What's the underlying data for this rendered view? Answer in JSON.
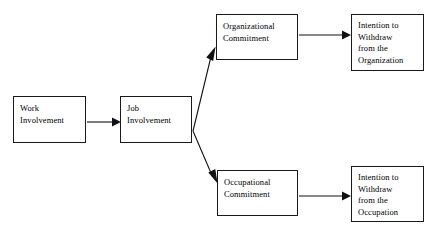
{
  "diagram": {
    "background_color": "#ffffff",
    "line_color": "#111111",
    "text_color": "#000000",
    "box_border_color": "#1a1a1a",
    "nodes": [
      {
        "id": "work-involvement",
        "label": "Work\nInvolvement",
        "x": 13,
        "y": 96,
        "w": 73,
        "h": 47
      },
      {
        "id": "job-involvement",
        "label": "Job\nInvolvement",
        "x": 120,
        "y": 96,
        "w": 72,
        "h": 47
      },
      {
        "id": "organizational-commitment",
        "label": "Organizational\nCommitment",
        "x": 216,
        "y": 14,
        "w": 82,
        "h": 46
      },
      {
        "id": "occupational-commitment",
        "label": "Occupational\nCommitment",
        "x": 217,
        "y": 170,
        "w": 81,
        "h": 46
      },
      {
        "id": "intention-withdraw-organization",
        "label": "Intention to\nWithdraw\nfrom the\nOrganization",
        "x": 351,
        "y": 14,
        "w": 73,
        "h": 57
      },
      {
        "id": "intention-withdraw-occupation",
        "label": "Intention to\nWithdraw\nfrom the\nOccupation",
        "x": 351,
        "y": 166,
        "w": 73,
        "h": 56
      }
    ],
    "edges": [
      {
        "id": "work-to-job",
        "from": "work-involvement",
        "to": "job-involvement",
        "kind": "straight-horizontal"
      },
      {
        "id": "job-to-organizational",
        "from": "job-involvement",
        "to": "organizational-commitment",
        "kind": "diagonal-up"
      },
      {
        "id": "job-to-occupational",
        "from": "job-involvement",
        "to": "occupational-commitment",
        "kind": "diagonal-down"
      },
      {
        "id": "organizational-to-intention",
        "from": "organizational-commitment",
        "to": "intention-withdraw-organization",
        "kind": "straight-horizontal"
      },
      {
        "id": "occupational-to-intention",
        "from": "occupational-commitment",
        "to": "intention-withdraw-occupation",
        "kind": "straight-horizontal"
      }
    ]
  }
}
